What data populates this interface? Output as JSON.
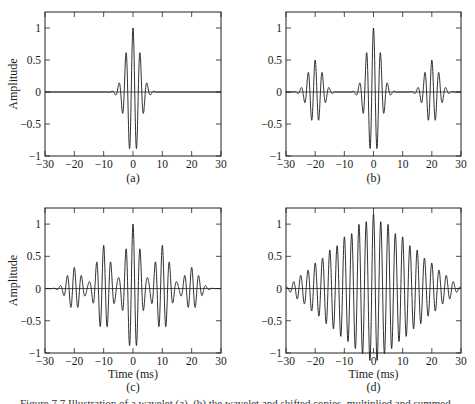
{
  "figure": {
    "caption": "Figure 7.7 Illustration of a wavelet (a), (b) the wavelet and shifted copies, multiplied and summed ..."
  },
  "chart_data": [
    {
      "id": "a",
      "type": "line",
      "panel_label": "(a)",
      "title": "",
      "xlabel": "",
      "ylabel": "Amplitude",
      "xlim": [
        -30,
        30
      ],
      "ylim": [
        -1,
        1.25
      ],
      "xticks": [
        -30,
        -20,
        -10,
        0,
        10,
        20,
        30
      ],
      "yticks": [
        -1,
        -0.5,
        0,
        0.5,
        1
      ],
      "ytick_labels": [
        "−1",
        "−0.5",
        "0",
        "0.5",
        "1"
      ],
      "xtick_labels": [
        "−30",
        "−20",
        "−10",
        "0",
        "10",
        "20",
        "30"
      ],
      "grid": false,
      "description": "Single wavelet centered at 0, peak 1, side lobes -0.6 at ±1.2, +0.36 at ±2.4, decays by ±10",
      "wavelets": [
        {
          "center": 0,
          "amp": 1.0
        }
      ]
    },
    {
      "id": "b",
      "type": "line",
      "panel_label": "(b)",
      "title": "",
      "xlabel": "",
      "ylabel": "",
      "xlim": [
        -30,
        30
      ],
      "ylim": [
        -1,
        1.25
      ],
      "xticks": [
        -30,
        -20,
        -10,
        0,
        10,
        20,
        30
      ],
      "yticks": [
        -1,
        -0.5,
        0,
        0.5,
        1
      ],
      "ytick_labels": [
        "−1",
        "−0.5",
        "0",
        "0.5",
        "1"
      ],
      "xtick_labels": [
        "−30",
        "−20",
        "−10",
        "0",
        "10",
        "20",
        "30"
      ],
      "grid": false,
      "description": "Wavelet at 0 (amp 1) plus copies at ±20 (amp 0.5)",
      "wavelets": [
        {
          "center": -20,
          "amp": 0.5
        },
        {
          "center": 0,
          "amp": 1.0
        },
        {
          "center": 20,
          "amp": 0.5
        }
      ]
    },
    {
      "id": "c",
      "type": "line",
      "panel_label": "(c)",
      "title": "",
      "xlabel": "Time (ms)",
      "ylabel": "Amplitude",
      "xlim": [
        -30,
        30
      ],
      "ylim": [
        -1,
        1.25
      ],
      "xticks": [
        -30,
        -20,
        -10,
        0,
        10,
        20,
        30
      ],
      "yticks": [
        -1,
        -0.5,
        0,
        0.5,
        1
      ],
      "ytick_labels": [
        "−1",
        "−0.5",
        "0",
        "0.5",
        "1"
      ],
      "xtick_labels": [
        "−30",
        "−20",
        "−10",
        "0",
        "10",
        "20",
        "30"
      ],
      "grid": false,
      "description": "Wavelets at 0 (amp 1), ±10 (amp 0.67), ±20 (amp 0.33)",
      "wavelets": [
        {
          "center": -20,
          "amp": 0.33
        },
        {
          "center": -10,
          "amp": 0.67
        },
        {
          "center": 0,
          "amp": 1.0
        },
        {
          "center": 10,
          "amp": 0.67
        },
        {
          "center": 20,
          "amp": 0.33
        }
      ]
    },
    {
      "id": "d",
      "type": "line",
      "panel_label": "(d)",
      "title": "",
      "xlabel": "Time (ms)",
      "ylabel": "",
      "xlim": [
        -30,
        30
      ],
      "ylim": [
        -1,
        1.25
      ],
      "xticks": [
        -30,
        -20,
        -10,
        0,
        10,
        20,
        30
      ],
      "yticks": [
        -1,
        -0.5,
        0,
        0.5,
        1
      ],
      "ytick_labels": [
        "−1",
        "−0.5",
        "0",
        "0.5",
        "1"
      ],
      "xtick_labels": [
        "−30",
        "−20",
        "−10",
        "0",
        "10",
        "20",
        "30"
      ],
      "grid": false,
      "description": "Wavelets every 5 ms with linearly decreasing amplitude: 0 (1.0), ±5 (0.83), ±10 (0.67), ±15 (0.5), ±20 (0.33), ±25 (0.17)",
      "wavelets": [
        {
          "center": -25,
          "amp": 0.17
        },
        {
          "center": -20,
          "amp": 0.33
        },
        {
          "center": -15,
          "amp": 0.5
        },
        {
          "center": -10,
          "amp": 0.67
        },
        {
          "center": -5,
          "amp": 0.83
        },
        {
          "center": 0,
          "amp": 1.0
        },
        {
          "center": 5,
          "amp": 0.83
        },
        {
          "center": 10,
          "amp": 0.67
        },
        {
          "center": 15,
          "amp": 0.5
        },
        {
          "center": 20,
          "amp": 0.33
        },
        {
          "center": 25,
          "amp": 0.17
        }
      ]
    }
  ],
  "layout": {
    "panels": [
      {
        "id": "a",
        "left": 45,
        "top": 12,
        "right": 221,
        "bottom": 156
      },
      {
        "id": "b",
        "left": 286,
        "top": 12,
        "right": 461,
        "bottom": 156
      },
      {
        "id": "c",
        "left": 45,
        "top": 208,
        "right": 221,
        "bottom": 353
      },
      {
        "id": "d",
        "left": 286,
        "top": 208,
        "right": 461,
        "bottom": 353
      }
    ],
    "line_color": "#1a1a1a",
    "axis_color": "#222222"
  }
}
